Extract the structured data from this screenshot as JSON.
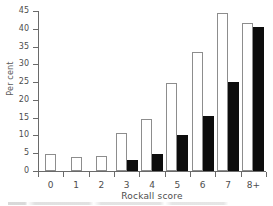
{
  "chart_data": {
    "type": "bar",
    "title": "",
    "subtitle": "",
    "xlabel": "Rockall score",
    "ylabel": "Per cent",
    "categories": [
      "0",
      "1",
      "2",
      "3",
      "4",
      "5",
      "6",
      "7",
      "8+"
    ],
    "series": [
      {
        "name": "open",
        "style": "open-white-bar",
        "values": [
          4.7,
          3.9,
          4.3,
          10.8,
          14.6,
          24.7,
          33.5,
          44.5,
          41.6
        ]
      },
      {
        "name": "filled",
        "style": "solid-black-bar",
        "values": [
          0,
          0,
          0,
          3.0,
          4.9,
          10.0,
          15.5,
          25.1,
          40.5
        ]
      }
    ],
    "ylim": [
      0,
      45
    ],
    "yticks": [
      0,
      5,
      10,
      15,
      20,
      25,
      30,
      35,
      40,
      45
    ],
    "ytick_labels": [
      "0",
      "5",
      "10",
      "15",
      "20",
      "25",
      "30",
      "35",
      "40",
      "45"
    ],
    "grid": false,
    "legend": "none",
    "legend_position": "none",
    "axis_color": "#6a6a6a",
    "open_bar_fill": "#ffffff",
    "open_bar_stroke": "#8d8d8d",
    "filled_bar_fill": "#0d0d0d",
    "background": "#ffffff"
  }
}
